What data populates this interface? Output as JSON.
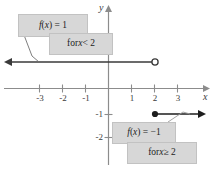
{
  "figure": {
    "axes": {
      "x_label": "x",
      "y_label": "y",
      "x_ticks": [
        "-3",
        "-2",
        "-1",
        "1",
        "2",
        "3"
      ],
      "y_ticks": [
        "2",
        "-1",
        "-2"
      ]
    },
    "callouts": {
      "upper_value": "f(x) = 1",
      "upper_condition": "for x < 2",
      "lower_value": "f(x) = -1",
      "lower_condition": "for x ≥ 2"
    },
    "colors": {
      "axis": "#8c8c8c",
      "curve": "#333333",
      "callout_fill": "#d7d7d7",
      "callout_border": "#c2c2c2",
      "text": "#1d1d1d"
    }
  },
  "chart_data": {
    "type": "line",
    "title": "",
    "xlabel": "x",
    "ylabel": "y",
    "xlim": [
      -3.8,
      4.3
    ],
    "ylim": [
      -2.6,
      2.5
    ],
    "grid": false,
    "legend": "none",
    "series": [
      {
        "name": "f(x) = 1 for x < 2",
        "y": 1,
        "x_start": -3.8,
        "x_end": 2,
        "left_arrow": true,
        "right_endpoint": "open"
      },
      {
        "name": "f(x) = -1 for x >= 2",
        "y": -1,
        "x_start": 2,
        "x_end": 4.3,
        "left_endpoint": "closed",
        "right_arrow": true
      }
    ],
    "annotations": [
      "f(x) = 1",
      "for x < 2",
      "f(x) = -1",
      "for x ≥ 2"
    ]
  }
}
